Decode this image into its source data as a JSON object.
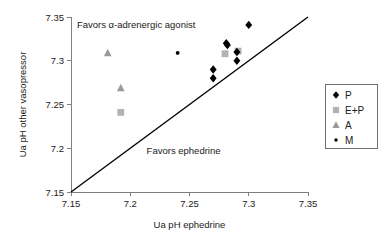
{
  "chart_data": {
    "type": "scatter",
    "title": "",
    "xlabel": "Ua pH ephedrine",
    "ylabel": "Ua pH other vasopressor",
    "xlim": [
      7.15,
      7.35
    ],
    "ylim": [
      7.15,
      7.35
    ],
    "xticks": [
      "7.15",
      "7.2",
      "7.25",
      "7.3",
      "7.35"
    ],
    "yticks": [
      "7.15",
      "7.2",
      "7.25",
      "7.3",
      "7.35"
    ],
    "xtick_values": [
      7.15,
      7.2,
      7.25,
      7.3,
      7.35
    ],
    "ytick_values": [
      7.15,
      7.2,
      7.25,
      7.3,
      7.35
    ],
    "grid": false,
    "legend_position": "right",
    "reference_line": {
      "name": "line-of-identity",
      "from": [
        7.15,
        7.15
      ],
      "to": [
        7.35,
        7.35
      ]
    },
    "annotations": [
      {
        "name": "favors-alpha-adrenergic-agonist",
        "text": "Favors α-adrenergic agonist",
        "x": 7.205,
        "y": 7.338
      },
      {
        "name": "favors-ephedrine",
        "text": "Favors ephedrine",
        "x": 7.245,
        "y": 7.193
      }
    ],
    "series": [
      {
        "name": "P",
        "label": "P",
        "marker": "diamond",
        "color": "#000000",
        "points": [
          {
            "x": 7.3,
            "y": 7.341
          },
          {
            "x": 7.281,
            "y": 7.32
          },
          {
            "x": 7.282,
            "y": 7.318
          },
          {
            "x": 7.29,
            "y": 7.31
          },
          {
            "x": 7.29,
            "y": 7.3
          },
          {
            "x": 7.27,
            "y": 7.29
          },
          {
            "x": 7.27,
            "y": 7.28
          }
        ]
      },
      {
        "name": "E+P",
        "label": "E+P",
        "marker": "square",
        "color": "#b3b3b3",
        "points": [
          {
            "x": 7.28,
            "y": 7.308
          },
          {
            "x": 7.291,
            "y": 7.311
          },
          {
            "x": 7.192,
            "y": 7.241
          }
        ]
      },
      {
        "name": "A",
        "label": "A",
        "marker": "triangle",
        "color": "#9a9a9a",
        "points": [
          {
            "x": 7.181,
            "y": 7.309
          },
          {
            "x": 7.192,
            "y": 7.269
          }
        ]
      },
      {
        "name": "M",
        "label": "M",
        "marker": "dot",
        "color": "#000000",
        "points": [
          {
            "x": 7.24,
            "y": 7.309
          }
        ]
      }
    ]
  },
  "legend": {
    "entries": [
      {
        "label": "P",
        "marker": "diamond"
      },
      {
        "label": "E+P",
        "marker": "square"
      },
      {
        "label": "A",
        "marker": "triangle"
      },
      {
        "label": "M",
        "marker": "dot"
      }
    ]
  }
}
